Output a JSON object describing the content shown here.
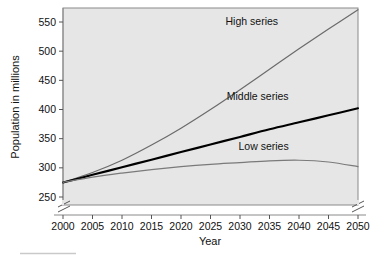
{
  "chart_data": {
    "type": "line",
    "title": "",
    "xlabel": "Year",
    "ylabel": "Population in millions",
    "xlim": [
      2000,
      2050
    ],
    "ylim": [
      250,
      571
    ],
    "grid": false,
    "legend_position": "inline-annotations",
    "axis_break": {
      "x_axis": true,
      "y_axis": true,
      "note": "break marks at both ends of x-axis / base of y-axis"
    },
    "xticks": [
      "2000",
      "2005",
      "2010",
      "2015",
      "2020",
      "2025",
      "2030",
      "2035",
      "2040",
      "2045",
      "2050"
    ],
    "yticks": [
      "250",
      "300",
      "350",
      "400",
      "450",
      "500",
      "550"
    ],
    "x": [
      2000,
      2005,
      2010,
      2015,
      2020,
      2025,
      2030,
      2035,
      2040,
      2045,
      2050
    ],
    "series": [
      {
        "name": "High series",
        "color": "#6b6b6b",
        "values": [
          275,
          292,
          313,
          339,
          368,
          400,
          434,
          469,
          504,
          538,
          571
        ]
      },
      {
        "name": "Middle series",
        "color": "#000000",
        "values": [
          275,
          288,
          301,
          314,
          327,
          340,
          353,
          366,
          378,
          390,
          402
        ]
      },
      {
        "name": "Low series",
        "color": "#7a7a7a",
        "values": [
          275,
          284,
          291,
          297,
          302,
          306,
          309,
          312,
          313,
          310,
          302
        ]
      }
    ],
    "annotations": [
      {
        "text": "High series",
        "x": 2032,
        "y": 545
      },
      {
        "text": "Middle series",
        "x": 2033,
        "y": 417
      },
      {
        "text": "Low series",
        "x": 2034,
        "y": 330
      }
    ],
    "colors": {
      "plot_background": "#e6e6e6",
      "figure_background": "#ffffff",
      "frame": "#8a8a8a",
      "text": "#111111",
      "high_series": "#6b6b6b",
      "middle_series": "#000000",
      "low_series": "#7a7a7a"
    }
  }
}
